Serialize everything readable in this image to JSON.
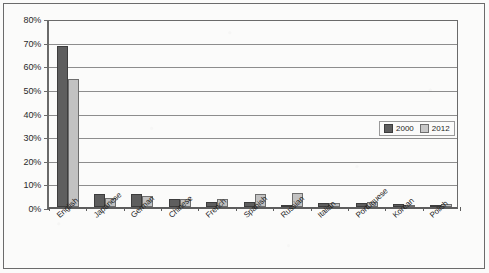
{
  "chart_data": {
    "type": "bar",
    "title": "",
    "subtitle": "",
    "xlabel": "",
    "ylabel": "",
    "ylim": [
      0,
      80
    ],
    "ytick_step": 10,
    "ytick_labels": [
      "0%",
      "10%",
      "20%",
      "30%",
      "40%",
      "50%",
      "60%",
      "70%",
      "80%"
    ],
    "ytick_values": [
      0,
      10,
      20,
      30,
      40,
      50,
      60,
      70,
      80
    ],
    "grid": true,
    "grid_axis": "y",
    "legend_position": "inside-upper-right",
    "categories": [
      "English",
      "Japanese",
      "German",
      "Chinese",
      "French",
      "Spanish",
      "Russian",
      "Italian",
      "Portuguese",
      "Korean",
      "Polish"
    ],
    "series": [
      {
        "name": "2000",
        "color": "#5e5e5e",
        "values": [
          68.0,
          5.5,
          5.5,
          3.2,
          2.3,
          2.3,
          1.0,
          1.6,
          1.7,
          1.3,
          0.4
        ]
      },
      {
        "name": "2012",
        "color": "#c2c2c2",
        "values": [
          54.0,
          3.8,
          4.8,
          3.5,
          3.3,
          5.5,
          5.8,
          1.6,
          2.2,
          0.3,
          1.2
        ]
      }
    ],
    "annotations": []
  },
  "legend": {
    "items": [
      {
        "label": "2000",
        "swatch": "dark-gray-swatch-icon"
      },
      {
        "label": "2012",
        "swatch": "light-gray-swatch-icon"
      }
    ]
  },
  "colors": {
    "series_2000": "#5e5e5e",
    "series_2012": "#c2c2c2",
    "gridline": "#8d8d8d",
    "axis": "#5d5d5d",
    "background": "#fbfbfa",
    "border": "#6b6b6b"
  }
}
